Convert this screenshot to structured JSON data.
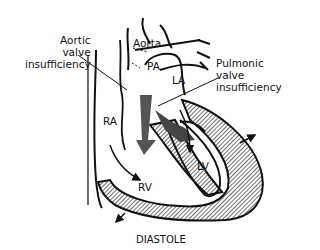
{
  "diagram": {
    "caption": "DIASTOLE",
    "labels": {
      "aortic": [
        "Aortic",
        "valve",
        "insufficiency"
      ],
      "pulmonic": [
        "Pulmonic",
        "valve",
        "insufficiency"
      ],
      "aorta": "Aorta",
      "pa": "PA",
      "la": "LA",
      "ra": "RA",
      "rv": "RV",
      "lv": "LV"
    }
  }
}
